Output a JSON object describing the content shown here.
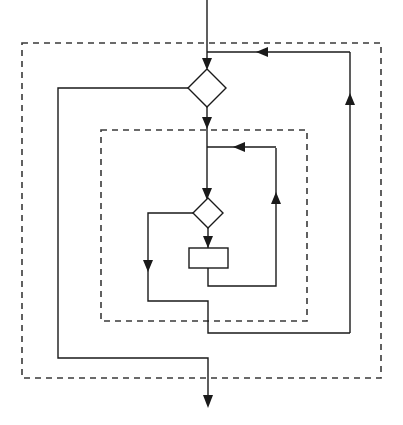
{
  "diagram": {
    "type": "flowchart",
    "canvas": {
      "width": 403,
      "height": 425,
      "background": "#ffffff"
    },
    "style": {
      "line_color": "#1a1a1a",
      "group_border_color": "#3a3a3a",
      "shape_fill": "#ffffff",
      "line_width": 1.4,
      "group_dash": "6 5"
    },
    "groups": [
      {
        "id": "outer-group",
        "name": "outer-dashed-group",
        "x": 22,
        "y": 43,
        "width": 359,
        "height": 335,
        "label": ""
      },
      {
        "id": "inner-group",
        "name": "inner-dashed-group",
        "x": 101,
        "y": 130,
        "width": 206,
        "height": 191,
        "label": ""
      }
    ],
    "nodes": [
      {
        "id": "outer-decision",
        "name": "outer-decision-diamond",
        "shape": "diamond",
        "cx": 207,
        "cy": 88,
        "rx": 19,
        "ry": 19,
        "label": ""
      },
      {
        "id": "inner-decision",
        "name": "inner-decision-diamond",
        "shape": "diamond",
        "cx": 208,
        "cy": 213,
        "rx": 15,
        "ry": 15,
        "label": ""
      },
      {
        "id": "process-box",
        "name": "process-rectangle",
        "shape": "rectangle",
        "x": 189,
        "y": 248,
        "width": 39,
        "height": 20,
        "label": ""
      }
    ],
    "edges": [
      {
        "id": "entry",
        "name": "entry-arrow",
        "points": "207,0 207,68",
        "arrow_at_end": true
      },
      {
        "id": "outer-feedback",
        "name": "outer-feedback-into-entry",
        "points": "350,52 207,52",
        "arrow_at_end": true
      },
      {
        "id": "outer-dec-to-inner",
        "name": "outer-decision-to-inner-group",
        "points": "207,107 207,143",
        "arrow_at_end": true
      },
      {
        "id": "outer-dec-left",
        "name": "outer-decision-false-branch",
        "points": "188,88 58,88 58,358 208,358 208,405",
        "arrow_at_end": true
      },
      {
        "id": "inner-top-join",
        "name": "inner-loop-top-join",
        "points": "276,147 207,147",
        "arrow_at_end": true
      },
      {
        "id": "inner-entry",
        "name": "inner-entry-to-decision",
        "points": "207,143 207,198",
        "arrow_at_end": true
      },
      {
        "id": "inner-dec-left",
        "name": "inner-decision-false-branch",
        "points": "193,213 148,213 148,301 208,301 208,333 350,333",
        "arrow_at_end": false
      },
      {
        "id": "inner-dec-left-mark",
        "name": "inner-false-branch-down-arrow",
        "points": "148,240 148,268",
        "arrow_at_end": true
      },
      {
        "id": "inner-dec-to-proc",
        "name": "inner-decision-to-process",
        "points": "208,228 208,246",
        "arrow_at_end": true
      },
      {
        "id": "proc-to-loopback",
        "name": "process-to-inner-loopback",
        "points": "208,268 208,286 276,286 276,148",
        "arrow_at_end": false
      },
      {
        "id": "proc-loopback-mark",
        "name": "inner-loopback-up-arrow",
        "points": "276,222 276,194",
        "arrow_at_end": true
      },
      {
        "id": "outer-return",
        "name": "outer-return-riser",
        "points": "350,333 350,52",
        "arrow_at_end": false
      },
      {
        "id": "outer-return-mark",
        "name": "outer-return-up-arrow",
        "points": "350,125 350,95",
        "arrow_at_end": true
      }
    ],
    "arrow_markers": [
      {
        "name": "entry-arrowhead",
        "x": 207,
        "y": 68,
        "dir": "down"
      },
      {
        "name": "outer-feedback-arrowhead",
        "x": 263,
        "y": 52,
        "dir": "left"
      },
      {
        "name": "outer-to-inner-arrowhead",
        "x": 207,
        "y": 127,
        "dir": "down"
      },
      {
        "name": "inner-top-join-arrowhead",
        "x": 241,
        "y": 147,
        "dir": "left"
      },
      {
        "name": "inner-decision-arrowhead",
        "x": 207,
        "y": 198,
        "dir": "down"
      },
      {
        "name": "inner-false-arrowhead",
        "x": 148,
        "y": 268,
        "dir": "down"
      },
      {
        "name": "process-entry-arrowhead",
        "x": 208,
        "y": 246,
        "dir": "down"
      },
      {
        "name": "inner-loopback-arrowhead",
        "x": 276,
        "y": 194,
        "dir": "up"
      },
      {
        "name": "outer-return-arrowhead",
        "x": 350,
        "y": 95,
        "dir": "up"
      },
      {
        "name": "exit-arrowhead",
        "x": 208,
        "y": 405,
        "dir": "down"
      }
    ]
  }
}
